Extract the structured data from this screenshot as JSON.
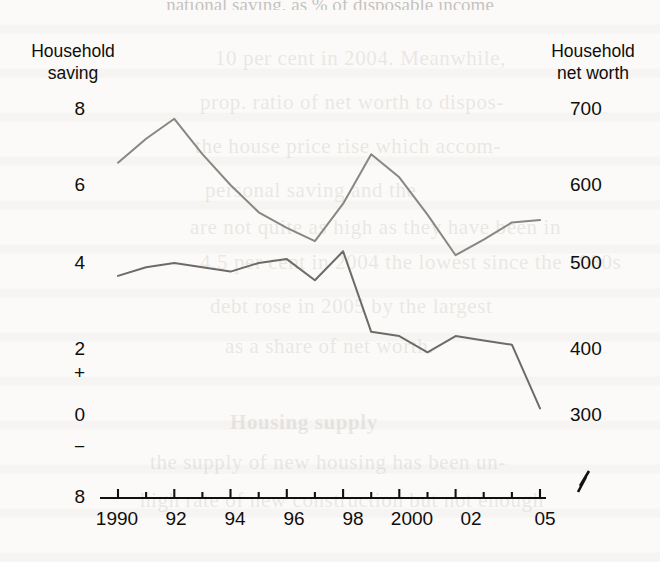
{
  "figure": {
    "title_partial": "national saving, as % of disposable income",
    "left_axis_title_line1": "Household",
    "left_axis_title_line2": "saving",
    "right_axis_title_line1": "Household",
    "right_axis_title_line2": "net worth",
    "axis_break_symbol": "break-zigzag"
  },
  "chart_data": {
    "type": "line",
    "title": "national saving, as % of disposable income",
    "xlabel": "",
    "ylabel": "Household saving",
    "y2label": "Household net worth",
    "grid": false,
    "legend": "none",
    "x": [
      1990,
      1991,
      1992,
      1993,
      1994,
      1995,
      1996,
      1997,
      1998,
      1999,
      2000,
      2001,
      2002,
      2003,
      2004,
      2005
    ],
    "xtick_labels": [
      "1990",
      "92",
      "94",
      "96",
      "98",
      "2000",
      "02",
      "05"
    ],
    "xtick_values": [
      1990,
      1992,
      1994,
      1996,
      1998,
      2000,
      2002,
      2005
    ],
    "xlim": [
      1990,
      2005
    ],
    "ylim": [
      -8,
      8
    ],
    "ytick_labels": [
      "8",
      "6",
      "4",
      "2",
      "0",
      "8"
    ],
    "ytick_values": [
      8,
      6,
      4,
      2,
      0,
      -8
    ],
    "y_sign_plus": "+",
    "y_sign_minus": "−",
    "y2lim": [
      300,
      700
    ],
    "y2tick_labels": [
      "700",
      "600",
      "500",
      "400",
      "300"
    ],
    "y2tick_values": [
      700,
      600,
      500,
      400,
      300
    ],
    "series": [
      {
        "name": "Household saving",
        "axis": "left",
        "color": "#6e6a66",
        "values": [
          3.7,
          3.9,
          4.0,
          3.9,
          3.8,
          4.0,
          4.1,
          3.6,
          4.3,
          2.4,
          2.3,
          1.9,
          2.3,
          2.2,
          2.1,
          0.2
        ]
      },
      {
        "name": "Household net worth",
        "axis": "right",
        "color": "#8a8682",
        "values": [
          629,
          660,
          686,
          640,
          600,
          565,
          545,
          528,
          576,
          640,
          610,
          562,
          510,
          530,
          552,
          555
        ]
      }
    ]
  },
  "ghost_lines": [
    "10 per cent in 2004. Meanwhile,",
    "prop. ratio of net worth to dispos-",
    "the house price rise which accom-",
    "personal saving and the",
    "are not quite as high as they have been in",
    "4.5 per cent in 2004 the lowest since the 1930s",
    "debt rose in 2005 by the largest",
    "as a share of net worth."
  ],
  "ghost_lines2": [
    "Housing supply",
    "the supply of new housing has been un-",
    "high rate of new construction but not enough"
  ]
}
